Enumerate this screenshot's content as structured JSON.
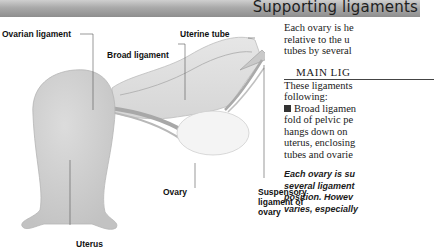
{
  "header": {
    "title": "Supporting ligaments"
  },
  "diagram": {
    "labels": {
      "ovarian_ligament": "Ovarian ligament",
      "uterine_tube": "Uterine tube",
      "broad_ligament": "Broad ligament",
      "ovary": "Ovary",
      "suspensory_1": "Suspensory",
      "suspensory_2": "ligament of",
      "suspensory_3": "ovary",
      "uterus": "Uterus"
    }
  },
  "text": {
    "intro": [
      "Each ovary is he",
      "relative to the u",
      "tubes by several"
    ],
    "section_title": "MAIN LIG",
    "section_body": [
      "These ligaments",
      "following:"
    ],
    "bullet_lines": [
      "Broad ligamen",
      "fold of pelvic pe",
      "hangs down on",
      "uterus, enclosing",
      "tubes and ovarie"
    ],
    "caption": [
      "Each ovary is su",
      "several ligament",
      "position. Howev",
      "varies, especially"
    ]
  },
  "colors": {
    "header_bg": "#a9a9a9",
    "tissue": "#d4d4d4",
    "ovary": "#f3f3f3",
    "leader": "#555555"
  }
}
